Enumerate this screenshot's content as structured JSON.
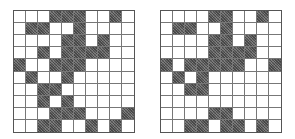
{
  "figure": {
    "grid_size": {
      "rows": 10,
      "cols": 10
    },
    "colors": {
      "filled": "#6a6a6a",
      "empty": "#ffffff",
      "line": "#777777"
    },
    "grids": [
      {
        "id": "left",
        "rows": [
          "0001110010",
          "0110010000",
          "0000110100",
          "0010111100",
          "1001110000",
          "0100100000",
          "0011000000",
          "0010100000",
          "0001110001",
          "0011001010"
        ]
      },
      {
        "id": "right",
        "rows": [
          "0000110010",
          "0110010000",
          "0000110100",
          "0000111100",
          "1011111001",
          "0101000000",
          "0011000000",
          "0000000000",
          "0000110000",
          "0011011010"
        ]
      }
    ]
  }
}
